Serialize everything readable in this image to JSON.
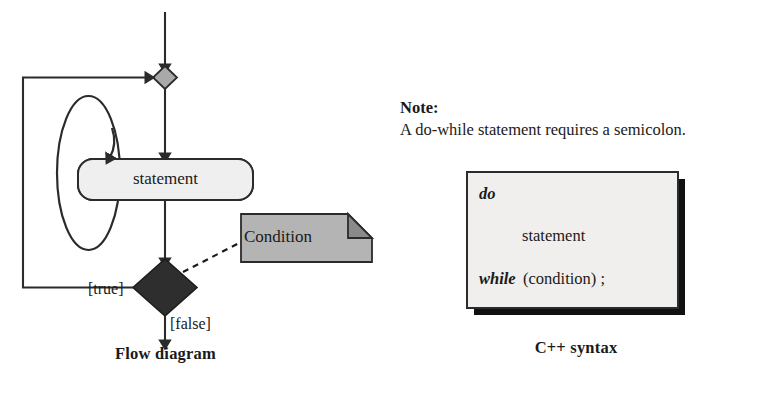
{
  "figure": {
    "kind": "uml-activity-flow-diagram"
  },
  "flow": {
    "caption": "Flow diagram",
    "statement_node": "statement",
    "note_shape_label": "Condition",
    "guard_true": "[true]",
    "guard_false": "[false]",
    "merge_node": "merge-diamond",
    "decision_node": "decision-diamond"
  },
  "note": {
    "heading": "Note:",
    "body": "A do-while statement requires a semicolon."
  },
  "syntax": {
    "caption": "C++ syntax",
    "line_do": "do",
    "line_statement": "statement",
    "line_while_keyword": "while",
    "line_while_rest": "(condition) ;"
  },
  "colors": {
    "ink": "#1a1a1a",
    "stroke": "#2b2b2b",
    "statement_fill": "#efefef",
    "merge_diamond_fill": "#a9a9a9",
    "decision_diamond_fill": "#2e2e2e",
    "condition_note_fill": "#b4b4b4",
    "condition_fold_fill": "#8a8a8a",
    "syntax_box_fill": "#f0efed",
    "syntax_box_shadow": "#111111",
    "background": "#ffffff"
  }
}
